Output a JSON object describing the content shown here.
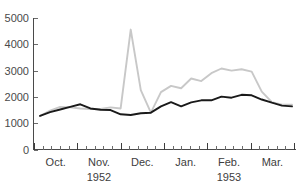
{
  "chart_data": {
    "type": "line",
    "title": "",
    "subtitle": "",
    "xlabel": "",
    "ylabel": "",
    "ylim": [
      0,
      5000
    ],
    "grid": false,
    "legend": "none",
    "y_ticks": [
      0,
      1000,
      2000,
      3000,
      4000,
      5000
    ],
    "y_tick_labels": [
      "0",
      "1000",
      "2000",
      "3000",
      "4000",
      "5000"
    ],
    "x_axis": {
      "months": [
        {
          "label": "Oct.",
          "index": 0
        },
        {
          "label": "Nov.",
          "index": 1
        },
        {
          "label": "Dec.",
          "index": 2
        },
        {
          "label": "Jan.",
          "index": 3
        },
        {
          "label": "Feb.",
          "index": 4
        },
        {
          "label": "Mar.",
          "index": 5
        }
      ],
      "years": [
        {
          "label": "1952",
          "month_index": 1
        },
        {
          "label": "1953",
          "month_index": 4
        }
      ],
      "tick_interval": "weekly",
      "major_tick_interval": "monthly"
    },
    "x": [
      0,
      1,
      2,
      3,
      4,
      5,
      6,
      7,
      8,
      9,
      10,
      11,
      12,
      13,
      14,
      15,
      16,
      17,
      18,
      19,
      20,
      21,
      22,
      23,
      24,
      25
    ],
    "series": [
      {
        "name": "series-black",
        "color": "#1a1a1a",
        "width": 1.9,
        "values": [
          1280,
          1420,
          1520,
          1620,
          1720,
          1560,
          1510,
          1500,
          1340,
          1310,
          1380,
          1400,
          1640,
          1800,
          1640,
          1790,
          1870,
          1870,
          2010,
          1970,
          2080,
          2060,
          1900,
          1780,
          1670,
          1640
        ]
      },
      {
        "name": "series-gray",
        "color": "#c8c8c8",
        "width": 1.9,
        "values": [
          1270,
          1480,
          1620,
          1600,
          1560,
          1540,
          1540,
          1600,
          1560,
          4560,
          2260,
          1400,
          2180,
          2420,
          2330,
          2700,
          2600,
          2900,
          3080,
          3000,
          3050,
          2960,
          2200,
          1800,
          1700,
          1700
        ]
      }
    ]
  }
}
